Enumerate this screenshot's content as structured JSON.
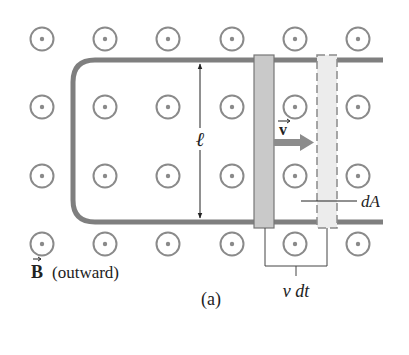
{
  "figure": {
    "panel_label": "(a)",
    "field_label": {
      "symbol": "B",
      "description": "(outward)"
    },
    "length_label": "ℓ",
    "velocity_label": "v",
    "area_label": "dA",
    "displacement_label": "v dt",
    "field_grid": {
      "columns_x": [
        42,
        105,
        168,
        232,
        295,
        358
      ],
      "rows_y": [
        39,
        107,
        176,
        244
      ],
      "symbol": "dot-in-circle (field out of page)"
    },
    "colors": {
      "rail": "#7f7f7f",
      "field_symbol": "#8a8a8a",
      "bar_solid": "#c9c9c9",
      "bar_dashed": "#ececec",
      "arrow": "#8c8c8c",
      "text": "#222222"
    }
  }
}
